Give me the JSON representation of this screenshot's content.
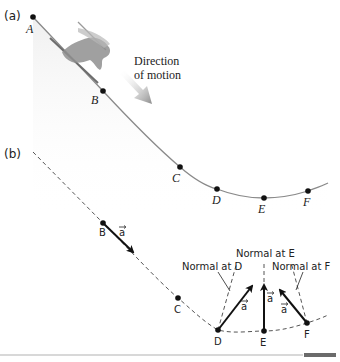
{
  "panel_a": {
    "label": "(a)",
    "points": [
      {
        "name": "A",
        "label": "A"
      },
      {
        "name": "B",
        "label": "B"
      },
      {
        "name": "C",
        "label": "C"
      },
      {
        "name": "D",
        "label": "D"
      },
      {
        "name": "E",
        "label": "E"
      },
      {
        "name": "F",
        "label": "F"
      }
    ],
    "direction_label_line1": "Direction",
    "direction_label_line2": "of motion"
  },
  "panel_b": {
    "label": "(b)",
    "points": [
      {
        "name": "B",
        "label": "B"
      },
      {
        "name": "C",
        "label": "C"
      },
      {
        "name": "D",
        "label": "D"
      },
      {
        "name": "E",
        "label": "E"
      },
      {
        "name": "F",
        "label": "F"
      }
    ],
    "accel_symbol": "a",
    "normal_d": "Normal at D",
    "normal_e": "Normal at E",
    "normal_f": "Normal at F"
  },
  "colors": {
    "track": "#8a8a8a",
    "dashed": "#555555",
    "arrow": "#111111",
    "direction_arrow": "#9a9a9a",
    "bar_light": "#d8d8d8",
    "bar_dark": "#6b6b6b"
  }
}
